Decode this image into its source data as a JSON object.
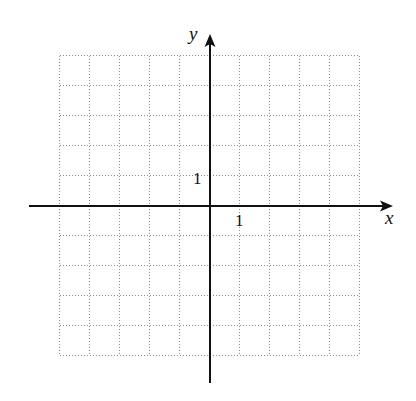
{
  "diagram": {
    "type": "coordinate-plane",
    "x_axis_label": "x",
    "y_axis_label": "y",
    "x_tick_label": "1",
    "y_tick_label": "1",
    "grid": {
      "x_min": -5,
      "x_max": 5,
      "y_min": -5,
      "y_max": 5,
      "step": 1,
      "style": "dotted"
    },
    "colors": {
      "axis": "#111111",
      "grid": "#8a8a8a",
      "background": "#ffffff"
    }
  }
}
